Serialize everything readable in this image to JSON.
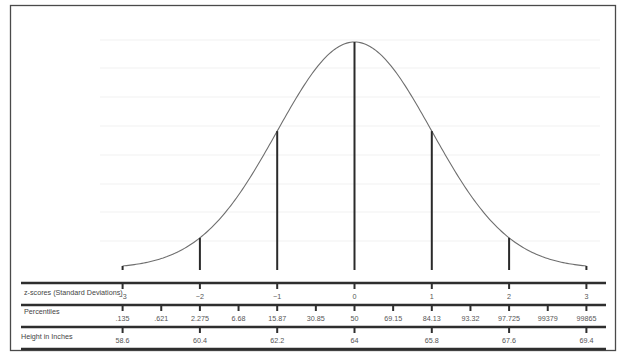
{
  "chart_data": {
    "type": "line",
    "title": "",
    "distribution": {
      "mean": 64,
      "sd": 1.8,
      "unit": "inches"
    },
    "xlim": [
      -3,
      3
    ],
    "grid": false,
    "legend": null,
    "vertical_markers_z": [
      -2,
      -1,
      0,
      1,
      2
    ],
    "rows": [
      {
        "label": "z-scores (Standard Deviations)",
        "ticks": [
          {
            "z": -3,
            "label": "−3"
          },
          {
            "z": -2,
            "label": "−2"
          },
          {
            "z": -1,
            "label": "−1"
          },
          {
            "z": 0,
            "label": "0"
          },
          {
            "z": 1,
            "label": "1"
          },
          {
            "z": 2,
            "label": "2"
          },
          {
            "z": 3,
            "label": "3"
          }
        ]
      },
      {
        "label": "Percentiles",
        "ticks": [
          {
            "z": -3,
            "label": ".135"
          },
          {
            "z": -2.5,
            "label": ".621"
          },
          {
            "z": -2,
            "label": "2.275"
          },
          {
            "z": -1.5,
            "label": "6.68"
          },
          {
            "z": -1,
            "label": "15.87"
          },
          {
            "z": -0.5,
            "label": "30.85"
          },
          {
            "z": 0,
            "label": "50"
          },
          {
            "z": 0.5,
            "label": "69.15"
          },
          {
            "z": 1,
            "label": "84.13"
          },
          {
            "z": 1.5,
            "label": "93.32"
          },
          {
            "z": 2,
            "label": "97.725"
          },
          {
            "z": 2.5,
            "label": "99379"
          },
          {
            "z": 3,
            "label": "99865"
          }
        ]
      },
      {
        "label": "Height in Inches",
        "ticks": [
          {
            "z": -3,
            "label": "58.6"
          },
          {
            "z": -2,
            "label": "60.4"
          },
          {
            "z": -1,
            "label": "62.2"
          },
          {
            "z": 0,
            "label": "64"
          },
          {
            "z": 1,
            "label": "65.8"
          },
          {
            "z": 2,
            "label": "67.6"
          },
          {
            "z": 3,
            "label": "69.4"
          }
        ]
      }
    ]
  },
  "colors": {
    "frame": "#4a4a4a",
    "curve": "#6e6e6e",
    "axis": "#2e2e2e",
    "text": "#555555"
  }
}
